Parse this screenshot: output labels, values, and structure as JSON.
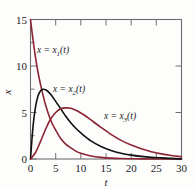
{
  "chart_data": {
    "type": "line",
    "title": "",
    "xlabel": "t",
    "ylabel": "x",
    "xlim": [
      0,
      30
    ],
    "ylim": [
      0,
      15
    ],
    "grid": false,
    "legend_position": "inline-annotations",
    "xticks": [
      0,
      5,
      10,
      15,
      20,
      25,
      30
    ],
    "xtick_labels": [
      "0",
      "5",
      "10",
      "15",
      "20",
      "25",
      "30"
    ],
    "yticks": [
      0,
      5,
      10,
      15
    ],
    "ytick_labels": [
      "0",
      "5",
      "10",
      "15"
    ],
    "series": [
      {
        "name": "x = x₁(t)",
        "label_base": "x = x",
        "label_sub": "1",
        "label_tail": "(t)",
        "color": "#8c2433",
        "x": [
          0,
          0.5,
          1,
          1.5,
          2,
          3,
          4,
          5,
          6,
          7,
          8,
          9,
          10,
          12,
          14,
          16,
          18,
          20,
          22,
          24,
          26,
          28,
          30
        ],
        "values": [
          15.0,
          12.8,
          10.9,
          9.3,
          8.0,
          5.8,
          4.2,
          3.1,
          2.2,
          1.6,
          1.2,
          0.85,
          0.62,
          0.33,
          0.17,
          0.09,
          0.05,
          0.03,
          0.015,
          0.008,
          0.004,
          0.002,
          0.0
        ]
      },
      {
        "name": "x = x₂(t)",
        "label_base": "x = x",
        "label_sub": "2",
        "label_tail": "(t)",
        "color": "#111111",
        "x": [
          0,
          0.5,
          1,
          1.5,
          2,
          2.5,
          3,
          3.5,
          4,
          5,
          6,
          7,
          8,
          9,
          10,
          12,
          14,
          16,
          18,
          20,
          22,
          24,
          26,
          28,
          30
        ],
        "values": [
          0.0,
          3.5,
          5.6,
          6.8,
          7.35,
          7.5,
          7.45,
          7.25,
          6.95,
          6.2,
          5.4,
          4.6,
          3.9,
          3.3,
          2.8,
          1.95,
          1.35,
          0.92,
          0.62,
          0.42,
          0.28,
          0.18,
          0.12,
          0.07,
          0.0
        ]
      },
      {
        "name": "x = x₃(t)",
        "label_base": "x = x",
        "label_sub": "3",
        "label_tail": "(t)",
        "color": "#8c2433",
        "x": [
          0,
          1,
          2,
          3,
          4,
          5,
          6,
          7,
          8,
          9,
          10,
          11,
          12,
          14,
          16,
          18,
          20,
          22,
          24,
          26,
          28,
          30
        ],
        "values": [
          0.0,
          0.7,
          1.9,
          3.2,
          4.3,
          5.0,
          5.4,
          5.5,
          5.45,
          5.25,
          4.95,
          4.6,
          4.2,
          3.4,
          2.65,
          2.0,
          1.5,
          1.1,
          0.78,
          0.55,
          0.38,
          0.25
        ]
      }
    ],
    "annotations": [
      {
        "text": "x = x₁(t)",
        "x_px": 37,
        "y_px": 53
      },
      {
        "text": "x = x₂(t)",
        "x_px": 53,
        "y_px": 92
      },
      {
        "text": "x = x₃(t)",
        "x_px": 104,
        "y_px": 119
      }
    ]
  }
}
